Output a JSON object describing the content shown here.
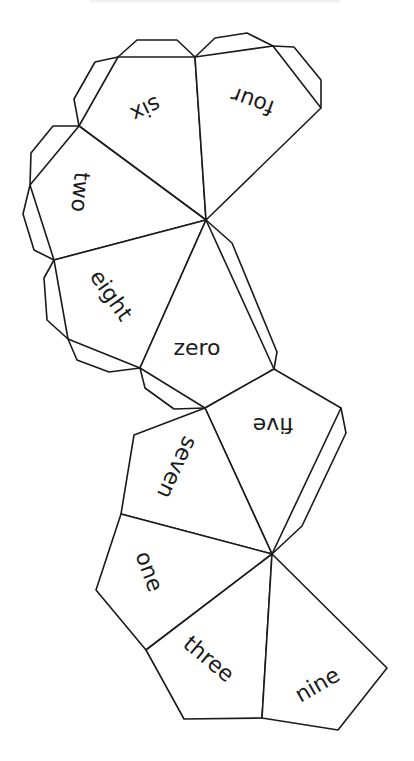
{
  "diagram": {
    "type": "polyhedron-net",
    "stroke_color": "#1a1a1a",
    "background_color": "#ffffff",
    "faces": [
      {
        "id": "six",
        "label": "six"
      },
      {
        "id": "four",
        "label": "four"
      },
      {
        "id": "two",
        "label": "two"
      },
      {
        "id": "eight",
        "label": "eight"
      },
      {
        "id": "zero",
        "label": "zero"
      },
      {
        "id": "five",
        "label": "five"
      },
      {
        "id": "seven",
        "label": "seven"
      },
      {
        "id": "one",
        "label": "one"
      },
      {
        "id": "three",
        "label": "three"
      },
      {
        "id": "nine",
        "label": "nine"
      }
    ],
    "apexes": {
      "upper": "shared vertex of six, four, two, eight, zero",
      "lower": "shared vertex of five, seven, one, three, nine"
    }
  }
}
